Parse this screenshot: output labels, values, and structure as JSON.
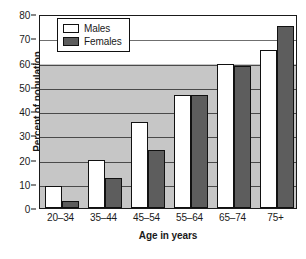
{
  "chart_data": {
    "type": "bar",
    "title": "",
    "subtitle": "",
    "xlabel": "Age in years",
    "ylabel": "Percent of population",
    "categories": [
      "20–34",
      "35–44",
      "45–54",
      "55–64",
      "65–74",
      "75+"
    ],
    "series": [
      {
        "name": "Males",
        "color": "#ffffff",
        "values": [
          9,
          20,
          35.5,
          46.5,
          59.5,
          65
        ]
      },
      {
        "name": "Females",
        "color": "#5d5d5d",
        "values": [
          3,
          12.5,
          24,
          46.5,
          58.5,
          75
        ]
      }
    ],
    "ylim": [
      0,
      80
    ],
    "yticks": [
      0,
      10,
      20,
      30,
      40,
      50,
      60,
      70,
      80
    ],
    "ytick_labels": [
      "0",
      "10",
      "20",
      "30",
      "40",
      "50",
      "60",
      "70",
      "80"
    ],
    "grid": true,
    "grid_axis": "y",
    "legend_position": "top-left",
    "plot_background_below_60": "#c6c6c6",
    "plot_background_above_60": "#ffffff",
    "axis_color": "#1a1a1a"
  },
  "legend": {
    "entries": [
      {
        "label": "Males"
      },
      {
        "label": "Females"
      }
    ]
  }
}
